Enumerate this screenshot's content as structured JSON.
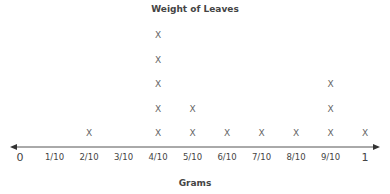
{
  "chart_data": {
    "type": "line plot (dot plot)",
    "title": "Weight of Leaves",
    "xlabel": "Grams",
    "ylabel": "",
    "marker": "X",
    "categories": [
      "0",
      "1/10",
      "2/10",
      "3/10",
      "4/10",
      "5/10",
      "6/10",
      "7/10",
      "8/10",
      "9/10",
      "1"
    ],
    "values": [
      0,
      0,
      1,
      0,
      5,
      2,
      1,
      1,
      1,
      3,
      1
    ],
    "xlim": [
      0,
      1
    ],
    "grid": false,
    "legend": null
  }
}
